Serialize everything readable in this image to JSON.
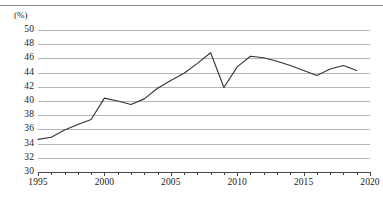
{
  "chart_data": {
    "type": "line",
    "title": "",
    "subtitle": "",
    "xlabel": "(년)",
    "ylabel": "(%)",
    "yunit": "(%)",
    "xunit": "(년)",
    "xlim": [
      1995,
      2020
    ],
    "ylim": [
      30,
      50
    ],
    "ytick_step": 2,
    "xtick_step": 1,
    "xtick_label_step": 5,
    "grid": "horizontal",
    "legend": "none",
    "line_color": "#333333",
    "grid_color": "#b6b6b6",
    "axis_color": "#4a4a4a",
    "ytick_labels": [
      "50",
      "48",
      "46",
      "44",
      "42",
      "40",
      "38",
      "36",
      "34",
      "32",
      "30"
    ],
    "ytick_values": [
      50,
      48,
      46,
      44,
      42,
      40,
      38,
      36,
      34,
      32,
      30
    ],
    "xtick_labels": [
      "1995",
      "2000",
      "2005",
      "2010",
      "2015",
      "2020"
    ],
    "xtick_values": [
      1995,
      2000,
      2005,
      2010,
      2015,
      2020
    ],
    "x": [
      1995,
      1996,
      1997,
      1998,
      1999,
      2000,
      2001,
      2002,
      2003,
      2004,
      2005,
      2006,
      2007,
      2008,
      2009,
      2010,
      2011,
      2012,
      2013,
      2014,
      2015,
      2016,
      2017,
      2018,
      2019
    ],
    "values": [
      34.6,
      34.9,
      35.9,
      36.7,
      37.4,
      40.4,
      40.0,
      39.5,
      40.3,
      41.8,
      42.9,
      43.9,
      45.3,
      46.8,
      41.9,
      44.8,
      46.3,
      46.1,
      45.6,
      45.0,
      44.3,
      43.6,
      44.5,
      45.0,
      44.3
    ],
    "series": [
      {
        "name": "",
        "values": [
          34.6,
          34.9,
          35.9,
          36.7,
          37.4,
          40.4,
          40.0,
          39.5,
          40.3,
          41.8,
          42.9,
          43.9,
          45.3,
          46.8,
          41.9,
          44.8,
          46.3,
          46.1,
          45.6,
          45.0,
          44.3,
          43.6,
          44.5,
          45.0,
          44.3
        ]
      }
    ]
  }
}
